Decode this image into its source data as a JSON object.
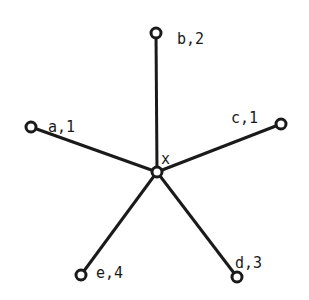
{
  "diagram": {
    "type": "star-graph",
    "center": {
      "id": "x",
      "label": "x",
      "cx": 157,
      "cy": 172,
      "lx": 161,
      "ly": 159
    },
    "leaves": [
      {
        "id": "b",
        "label": "b,2",
        "cx": 156,
        "cy": 33,
        "lx": 177,
        "ly": 39
      },
      {
        "id": "a",
        "label": "a,1",
        "cx": 31,
        "cy": 127,
        "lx": 48,
        "ly": 127
      },
      {
        "id": "c",
        "label": "c,1",
        "cx": 281,
        "cy": 124,
        "lx": 231,
        "ly": 118
      },
      {
        "id": "e",
        "label": "e,4",
        "cx": 81,
        "cy": 275,
        "lx": 96,
        "ly": 273
      },
      {
        "id": "d",
        "label": "d,3",
        "cx": 237,
        "cy": 277,
        "lx": 235,
        "ly": 263
      }
    ]
  }
}
